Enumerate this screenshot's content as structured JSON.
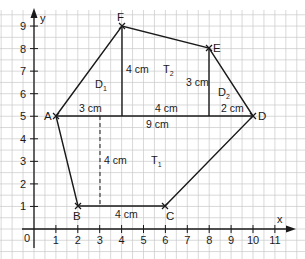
{
  "diagram": {
    "type": "coordinate-geometry",
    "axes": {
      "x_label": "x",
      "y_label": "y",
      "origin_label": "0",
      "x_ticks": [
        "1",
        "2",
        "3",
        "4",
        "5",
        "6",
        "7",
        "8",
        "9",
        "10",
        "11"
      ],
      "y_ticks": [
        "1",
        "2",
        "3",
        "4",
        "5",
        "6",
        "7",
        "8",
        "9"
      ]
    },
    "points": [
      {
        "name": "A",
        "x": 1,
        "y": 5
      },
      {
        "name": "B",
        "x": 2,
        "y": 1
      },
      {
        "name": "C",
        "x": 6,
        "y": 1
      },
      {
        "name": "D",
        "x": 10,
        "y": 5
      },
      {
        "name": "E",
        "x": 8,
        "y": 8
      },
      {
        "name": "F",
        "x": 4,
        "y": 9
      }
    ],
    "regions": [
      {
        "name": "D",
        "sub": "1"
      },
      {
        "name": "T",
        "sub": "2"
      },
      {
        "name": "D",
        "sub": "2"
      },
      {
        "name": "T",
        "sub": "1"
      }
    ],
    "measurements": {
      "af_base": "3 cm",
      "fe_height": "4 cm",
      "mid_base": "4 cm",
      "e_height": "3 cm",
      "ed_base": "2 cm",
      "ad_total": "9 cm",
      "t1_height": "4 cm",
      "bc_base": "4 cm"
    },
    "colors": {
      "grid": "#c8c8c8",
      "lines": "#1a1a1a",
      "background": "#ffffff"
    }
  }
}
